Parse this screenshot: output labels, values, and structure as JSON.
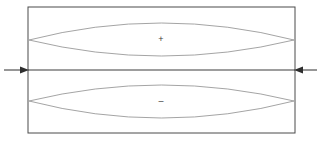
{
  "figure": {
    "title": "",
    "background_color": "#ffffff",
    "canvas": {
      "width": 320,
      "height": 152
    },
    "colors": {
      "boundary_stroke": "#4a4a4a",
      "lens_stroke": "#9a9a9a",
      "axis_stroke": "#3c3c3c",
      "arrow_fill": "#2e2e2e",
      "label_fill": "#3a3a3a"
    }
  },
  "boundary": {
    "name": "specimen-rectangle",
    "x": 28,
    "y": 7,
    "width": 267,
    "height": 126,
    "stroke_width": 1
  },
  "neutral_axis": {
    "name": "neutral-axis-line",
    "x1": 28,
    "y1": 70,
    "x2": 295,
    "y2": 70,
    "stroke_width": 1.2
  },
  "regions": [
    {
      "id": "upper-lens",
      "sign": "+",
      "label_x": 161,
      "label_y": 40,
      "left_x": 29,
      "left_y": 40,
      "right_x": 294,
      "right_y": 40,
      "top_apex_y": 23,
      "bottom_apex_y": 56,
      "stroke_width": 0.9
    },
    {
      "id": "lower-lens",
      "sign": "–",
      "label_x": 161,
      "label_y": 102,
      "left_x": 29,
      "left_y": 101,
      "right_x": 294,
      "right_y": 101,
      "top_apex_y": 85,
      "bottom_apex_y": 118,
      "stroke_width": 0.9
    }
  ],
  "load_arrows": [
    {
      "id": "left-load-arrow",
      "direction": "right",
      "tail_x": 4,
      "tip_x": 29,
      "y": 70,
      "shaft_width": 1,
      "head_length": 9,
      "head_half_height": 3.4
    },
    {
      "id": "right-load-arrow",
      "direction": "left",
      "tail_x": 317,
      "tip_x": 294,
      "y": 70,
      "shaft_width": 1,
      "head_length": 9,
      "head_half_height": 3.4
    }
  ]
}
